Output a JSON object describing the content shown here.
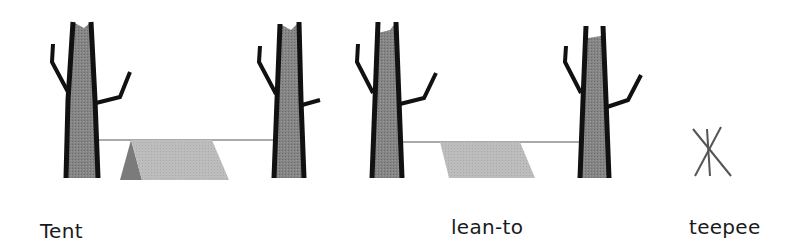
{
  "diagram": {
    "labels": {
      "tent": "Tent",
      "lean_to": "lean-to",
      "teepee": "teepee"
    },
    "colors": {
      "trunk_fill": "#7d7d7d",
      "trunk_outline": "#111111",
      "tent_side": "#8a8a8a",
      "tarp": "#b8b8b8",
      "rope": "#555555",
      "teepee_poles": "#555555"
    }
  }
}
